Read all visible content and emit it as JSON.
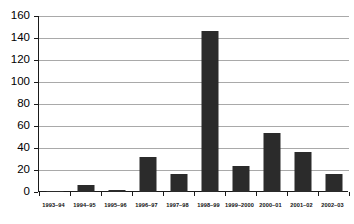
{
  "chart_data": {
    "type": "bar",
    "title": "",
    "subtitle": "",
    "xlabel": "",
    "ylabel": "",
    "categories": [
      "1993–94",
      "1994–95",
      "1995–96",
      "1996–97",
      "1997–98",
      "1998–99",
      "1999–2000",
      "2000–01",
      "2001–02",
      "2002–03"
    ],
    "values": [
      1,
      6,
      2,
      32,
      16,
      146,
      24,
      54,
      36,
      16
    ],
    "ylim": [
      0,
      160
    ],
    "ytick_step": 20,
    "yticks": [
      "0",
      "20",
      "40",
      "60",
      "80",
      "100",
      "120",
      "140",
      "160"
    ],
    "ytick_values": [
      0,
      20,
      40,
      60,
      80,
      100,
      120,
      140,
      160
    ],
    "grid": true,
    "grid_axis": "y",
    "legend": false,
    "legend_position": "none",
    "bar_color": "#2b2b2b",
    "grid_color": "#a9a9a9",
    "axis_color": "#1a1a1a",
    "background": "#ffffff"
  }
}
